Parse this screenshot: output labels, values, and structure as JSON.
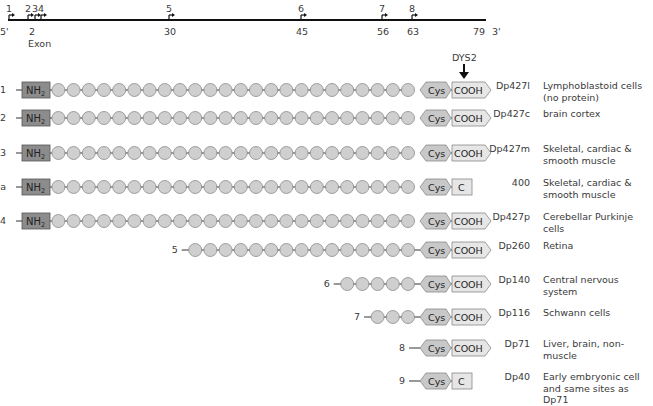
{
  "gene_map": {
    "five_prime": "5'",
    "three_prime": "3'",
    "exon_label": "Exon",
    "promoters": [
      {
        "label": "1",
        "x": 9
      },
      {
        "label": "2",
        "x": 28
      },
      {
        "label": "3",
        "x": 35
      },
      {
        "label": "4",
        "x": 41
      },
      {
        "label": "5",
        "x": 169
      },
      {
        "label": "6",
        "x": 301
      },
      {
        "label": "7",
        "x": 382
      },
      {
        "label": "8",
        "x": 412
      }
    ],
    "exons": [
      {
        "label": "2",
        "x": 31
      },
      {
        "label": "30",
        "x": 169
      },
      {
        "label": "45",
        "x": 301
      },
      {
        "label": "56",
        "x": 382
      },
      {
        "label": "63",
        "x": 412
      },
      {
        "label": "79",
        "x": 478
      }
    ]
  },
  "dys2_label": "DYS2",
  "domain_labels": {
    "nh2": "NH",
    "nh2_sub": "2",
    "cys": "Cys",
    "cooh": "COOH",
    "c": "C"
  },
  "isoforms": [
    {
      "promoter": "1",
      "name": "Dp427l",
      "tissue": "Lymphoblastoid cells\n(no protein)",
      "nh2": true,
      "circles": 24,
      "terminal": "COOH",
      "y": 90
    },
    {
      "promoter": "2",
      "name": "Dp427c",
      "tissue": "brain cortex",
      "nh2": true,
      "circles": 24,
      "terminal": "COOH",
      "y": 118
    },
    {
      "promoter": "3",
      "name": "Dp427m",
      "tissue": "Skeletal, cardiac &\nsmooth muscle",
      "nh2": true,
      "circles": 24,
      "terminal": "COOH",
      "y": 153
    },
    {
      "promoter": "3a",
      "name": "400",
      "tissue": "Skeletal, cardiac &\nsmooth muscle",
      "nh2": true,
      "circles": 24,
      "terminal": "C",
      "y": 187
    },
    {
      "promoter": "4",
      "name": "Dp427p",
      "tissue": "Cerebellar Purkinje cells",
      "nh2": true,
      "circles": 24,
      "terminal": "COOH",
      "y": 221
    },
    {
      "promoter": "5",
      "name": "Dp260",
      "tissue": "Retina",
      "nh2": false,
      "circles": 15,
      "terminal": "COOH",
      "y": 250
    },
    {
      "promoter": "6",
      "name": "Dp140",
      "tissue": "Central nervous system",
      "nh2": false,
      "circles": 5,
      "terminal": "COOH",
      "y": 284
    },
    {
      "promoter": "7",
      "name": "Dp116",
      "tissue": "Schwann cells",
      "nh2": false,
      "circles": 3,
      "terminal": "COOH",
      "y": 317
    },
    {
      "promoter": "8",
      "name": "Dp71",
      "tissue": "Liver, brain, non-muscle",
      "nh2": false,
      "circles": 0,
      "terminal": "COOH",
      "y": 348
    },
    {
      "promoter": "9",
      "name": "Dp40",
      "tissue": "Early embryonic cell\nand same sites as Dp71",
      "nh2": false,
      "circles": 0,
      "terminal": "C",
      "y": 381
    }
  ],
  "colors": {
    "line": "#111111",
    "circle_fill": "#cfcfcf",
    "circle_stroke": "#8a8a8a",
    "nh2_fill": "#8c8c8c",
    "nh2_stroke": "#555555",
    "cys_fill": "#c8c8c8",
    "cooh_fill": "#e6e6e6",
    "text": "#3a3a3a"
  }
}
